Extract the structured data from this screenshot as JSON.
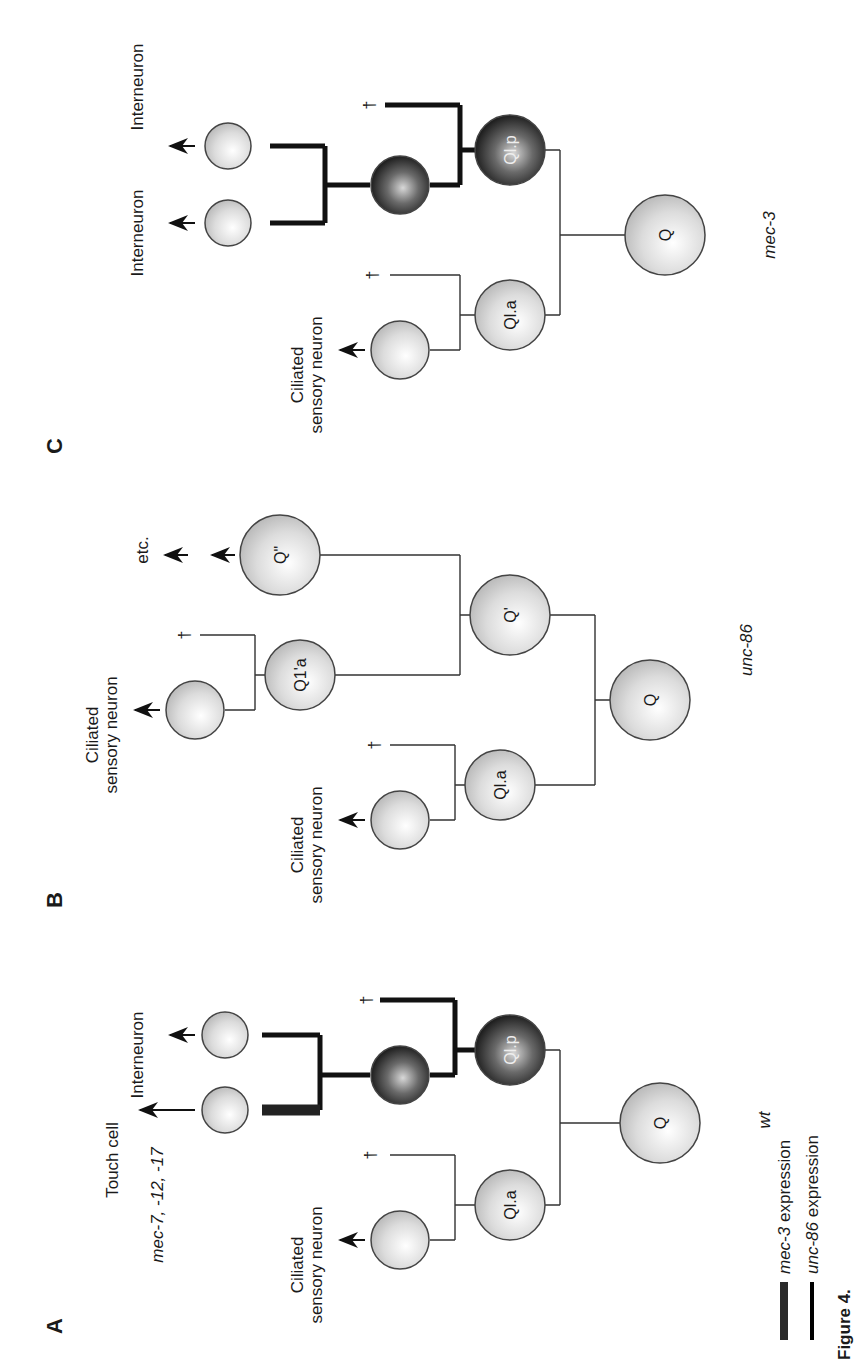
{
  "figure": {
    "caption_partial": "Figure 4.",
    "legend": [
      {
        "swatch": "thick-dark-bar",
        "gene": "mec-3",
        "text": "expression",
        "color": "#2a2a2a"
      },
      {
        "swatch": "thin-black-bar",
        "gene": "unc-86",
        "text": "expression",
        "color": "#000000"
      }
    ],
    "death_symbol": "†",
    "panels": [
      {
        "id": "A",
        "label": "A",
        "genotype": "wt",
        "cells": {
          "root": "Q",
          "anterior": "Ql.a",
          "posterior": "Ql.p"
        },
        "fates": {
          "ciliated": [
            "Ciliated",
            "sensory neuron"
          ],
          "touch": "Touch cell",
          "touch_genes": "mec-7, -12, -17",
          "inter": "Interneuron"
        }
      },
      {
        "id": "B",
        "label": "B",
        "genotype": "unc-86",
        "cells": {
          "root": "Q",
          "anterior": "Ql.a",
          "qprime": "Q'",
          "q1a": "Q1'a",
          "qdouble": "Q\""
        },
        "fates": {
          "ciliated1": [
            "Ciliated",
            "sensory neuron"
          ],
          "ciliated2": [
            "Ciliated",
            "sensory neuron"
          ],
          "etc": "etc."
        }
      },
      {
        "id": "C",
        "label": "C",
        "genotype": "mec-3",
        "cells": {
          "root": "Q",
          "anterior": "Ql.a",
          "posterior": "Ql.p"
        },
        "fates": {
          "ciliated": [
            "Ciliated",
            "sensory neuron"
          ],
          "inter1": "Interneuron",
          "inter2": "Interneuron"
        }
      }
    ],
    "colors": {
      "cell_light": "#d9d9d9",
      "cell_dark": "#2b2b2b",
      "line": "#333333"
    }
  }
}
